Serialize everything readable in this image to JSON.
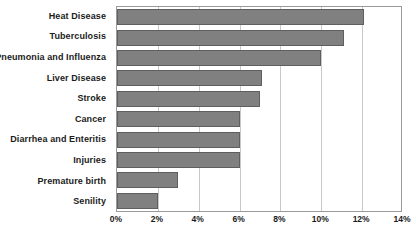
{
  "chart_data": {
    "type": "bar",
    "orientation": "horizontal",
    "title": "",
    "xlabel": "",
    "ylabel": "",
    "xlim": [
      0,
      14
    ],
    "xtick_step": 2,
    "grid": true,
    "legend": false,
    "bar_color": "#808080",
    "bar_border_color": "#5f5f5f",
    "gridline_color": "#c8c8c8",
    "axis_color": "#9a9a9a",
    "categories": [
      "Heat Disease",
      "Tuberculosis",
      "Pneumonia and Influenza",
      "Liver Disease",
      "Stroke",
      "Cancer",
      "Diarrhea and Enteritis",
      "Injuries",
      "Premature birth",
      "Senility"
    ],
    "values": [
      12.1,
      11.1,
      10.0,
      7.1,
      7.0,
      6.0,
      6.0,
      6.0,
      3.0,
      2.0
    ],
    "xticklabels": [
      "0%",
      "2%",
      "4%",
      "6%",
      "8%",
      "10%",
      "12%",
      "14%"
    ],
    "xtickvalues": [
      0,
      2,
      4,
      6,
      8,
      10,
      12,
      14
    ]
  },
  "caption": {
    "bottom_clipped_text": ""
  }
}
